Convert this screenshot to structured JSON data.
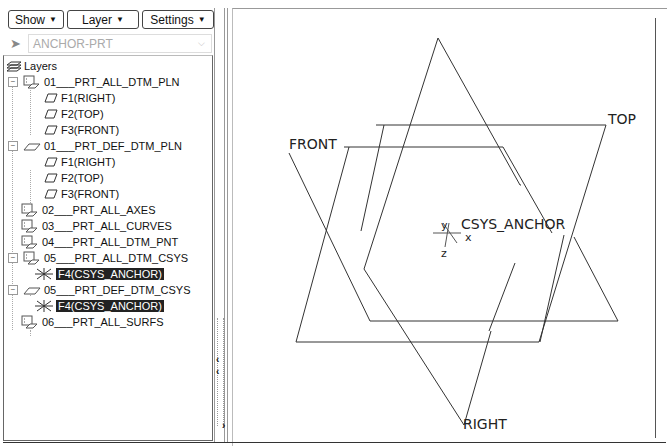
{
  "toolbar": {
    "show_label": "Show",
    "layer_label": "Layer",
    "settings_label": "Settings"
  },
  "selector": {
    "value": "ANCHOR-PRT"
  },
  "tree": {
    "root_label": "Layers",
    "items": [
      {
        "label": "01___PRT_ALL_DTM_PLN",
        "type": "layer",
        "expanded": true
      },
      {
        "label": "F1(RIGHT)",
        "type": "plane"
      },
      {
        "label": "F2(TOP)",
        "type": "plane"
      },
      {
        "label": "F3(FRONT)",
        "type": "plane"
      },
      {
        "label": "01___PRT_DEF_DTM_PLN",
        "type": "default-layer",
        "expanded": true
      },
      {
        "label": "F1(RIGHT)",
        "type": "plane"
      },
      {
        "label": "F2(TOP)",
        "type": "plane"
      },
      {
        "label": "F3(FRONT)",
        "type": "plane"
      },
      {
        "label": "02___PRT_ALL_AXES",
        "type": "layer"
      },
      {
        "label": "03___PRT_ALL_CURVES",
        "type": "layer"
      },
      {
        "label": "04___PRT_ALL_DTM_PNT",
        "type": "layer"
      },
      {
        "label": "05___PRT_ALL_DTM_CSYS",
        "type": "layer",
        "expanded": true
      },
      {
        "label": "F4(CSYS_ANCHOR)",
        "type": "csys",
        "selected": true
      },
      {
        "label": "05___PRT_DEF_DTM_CSYS",
        "type": "default-layer",
        "expanded": true
      },
      {
        "label": "F4(CSYS_ANCHOR)",
        "type": "csys",
        "selected": true
      },
      {
        "label": "06___PRT_ALL_SURFS",
        "type": "layer"
      }
    ]
  },
  "viewport": {
    "plane_labels": {
      "front": "FRONT",
      "top": "TOP",
      "right": "RIGHT"
    },
    "csys_label": "CSYS_ANCHOR",
    "axis_labels": {
      "x": "x",
      "y": "y",
      "z": "z"
    }
  }
}
